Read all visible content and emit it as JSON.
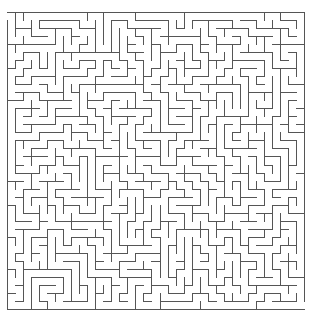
{
  "maze": {
    "cols": 37,
    "rows": 37,
    "cell_size": 8.05,
    "origin_x": 7,
    "origin_y": 12,
    "seed": 7919,
    "wall_color": "#555555",
    "background_color": "#ffffff",
    "entrance": {
      "side": "left",
      "row": 0
    },
    "exit": {
      "side": "right",
      "row": 36
    }
  }
}
